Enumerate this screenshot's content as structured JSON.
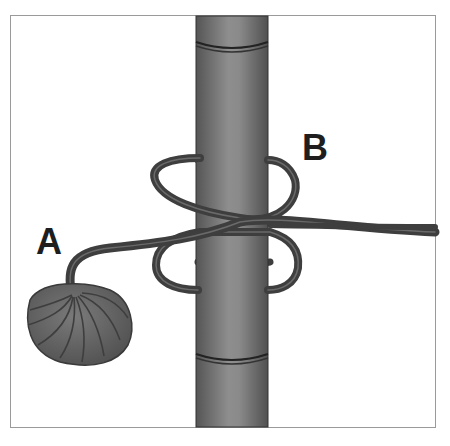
{
  "figure": {
    "type": "knot-tying illustration",
    "labels": [
      {
        "id": "A",
        "text": "A",
        "target": "rope standing end leading to coil"
      },
      {
        "id": "B",
        "text": "B",
        "target": "upper loop around pole"
      }
    ],
    "colors": {
      "background": "#ffffff",
      "frame": "#9a9a9a",
      "pole_dark": "#5a5a5a",
      "pole_light": "#8c8c8c",
      "rope": "#3e3e3e",
      "rope_highlight": "#6a6a6a",
      "coil": "#5e5e5e",
      "label": "#1e1e1e"
    }
  }
}
